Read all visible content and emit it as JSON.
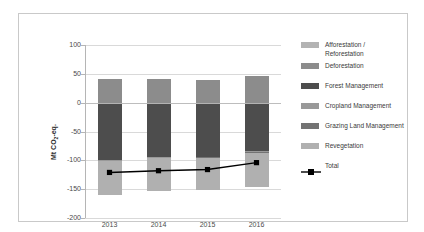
{
  "chart_data": {
    "type": "bar",
    "subtype": "stacked-bar-with-line",
    "title": "",
    "xlabel": "",
    "ylabel": "Mt CO2-eq.",
    "ylabel_html": "Mt CO<sub>2</sub>-eq.",
    "categories": [
      "2013",
      "2014",
      "2015",
      "2016"
    ],
    "ylim": [
      -200,
      100
    ],
    "yticks": [
      100,
      50,
      0,
      -50,
      -100,
      -150,
      -200
    ],
    "ytick_labels": [
      "100",
      "50",
      "0",
      "-50",
      "-100",
      "-150",
      "-200"
    ],
    "grid": true,
    "legend_position": "right",
    "series": [
      {
        "name": "Afforestation / Reforestation",
        "color": "#b3b3b3",
        "values": [
          -2.5,
          -2.5,
          -2.5,
          -2.5
        ]
      },
      {
        "name": "Deforestation",
        "color": "#8c8c8c",
        "values": [
          41,
          41,
          40,
          47
        ]
      },
      {
        "name": "Forest Management",
        "color": "#4d4d4d",
        "values": [
          -97,
          -92,
          -91,
          -82
        ]
      },
      {
        "name": "Cropland Management",
        "color": "#999999",
        "values": [
          -1,
          -1,
          -1,
          -1
        ]
      },
      {
        "name": "Grazing Land Management",
        "color": "#737373",
        "values": [
          -1,
          -1,
          -1,
          -1
        ]
      },
      {
        "name": "Revegetation",
        "color": "#b0b0b0",
        "values": [
          -58,
          -56,
          -56,
          -60
        ]
      }
    ],
    "line_series": {
      "name": "Total",
      "color": "#000000",
      "marker": "square",
      "values": [
        -121,
        -118,
        -116,
        -104
      ]
    }
  },
  "axis": {
    "y_title": "Mt CO",
    "y_title_sub": "2",
    "y_title_tail": "-eq.",
    "ticks": [
      "100",
      "50",
      "0",
      "-50",
      "-100",
      "-150",
      "-200"
    ],
    "x_labels": [
      "2013",
      "2014",
      "2015",
      "2016"
    ]
  },
  "legend": {
    "items": [
      {
        "label": "Afforestation /",
        "label2": "Reforestation",
        "color": "#b3b3b3"
      },
      {
        "label": "Deforestation",
        "label2": "",
        "color": "#8c8c8c"
      },
      {
        "label": "Forest Management",
        "label2": "",
        "color": "#4d4d4d"
      },
      {
        "label": "Cropland Management",
        "label2": "",
        "color": "#999999"
      },
      {
        "label": "Grazing Land Management",
        "label2": "",
        "color": "#737373"
      },
      {
        "label": "Revegetation",
        "label2": "",
        "color": "#b0b0b0"
      }
    ],
    "total_label": "Total",
    "total_color": "#000000"
  }
}
